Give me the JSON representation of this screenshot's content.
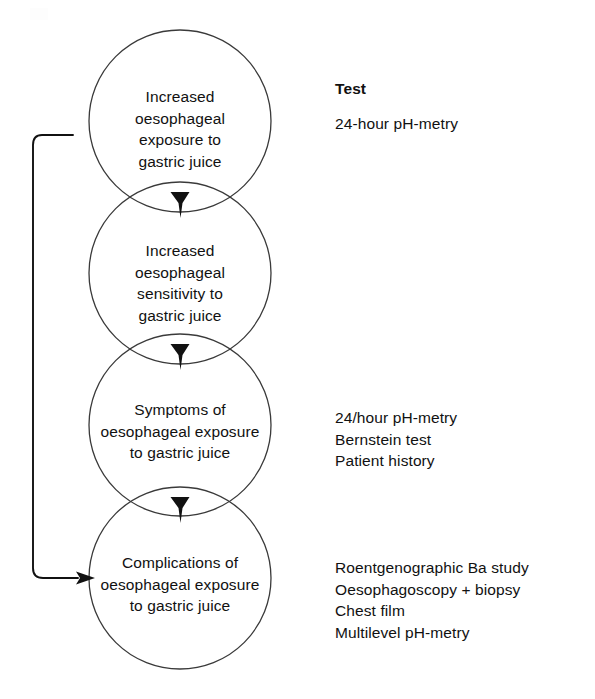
{
  "diagram": {
    "type": "vertical-chain-of-overlapping-circles",
    "stroke_color": "#3a3a3a",
    "arrow_color": "#111111",
    "background": "#ffffff",
    "circles": [
      {
        "id": "increased-exposure",
        "label": "Increased\noesophageal\nexposure to\ngastric juice",
        "cx": 180,
        "cy": 121,
        "r": 91
      },
      {
        "id": "increased-sensitivity",
        "label": "Increased\noesophageal\nsensitivity to\ngastric juice",
        "cx": 180,
        "cy": 273,
        "r": 91
      },
      {
        "id": "symptoms",
        "label": "Symptoms of\noesophageal exposure\nto gastric juice",
        "cx": 180,
        "cy": 425,
        "r": 91
      },
      {
        "id": "complications",
        "label": "Complications of\noesophageal exposure\nto gastric juice",
        "cx": 180,
        "cy": 578,
        "r": 91
      }
    ],
    "arrowheads": [
      {
        "id": "arrow-1-to-2",
        "x": 180,
        "y": 205
      },
      {
        "id": "arrow-2-to-3",
        "x": 180,
        "y": 357
      },
      {
        "id": "arrow-3-to-4",
        "x": 180,
        "y": 510
      }
    ],
    "feedback_arrow": {
      "id": "feedback-loop",
      "description": "bracket on left side running from the first circle down to the last circle",
      "from_y": 135,
      "to_y": 578,
      "x": 33
    }
  },
  "tests": {
    "header": "Test",
    "groups": [
      {
        "id": "tests-for-increased-exposure",
        "lines": "24-hour pH-metry"
      },
      {
        "id": "tests-for-symptoms",
        "lines": "24/hour pH-metry\nBernstein test\nPatient history"
      },
      {
        "id": "tests-for-complications",
        "lines": "Roentgenographic Ba study\nOesophagoscopy + biopsy\nChest film\nMultilevel pH-metry"
      }
    ]
  }
}
